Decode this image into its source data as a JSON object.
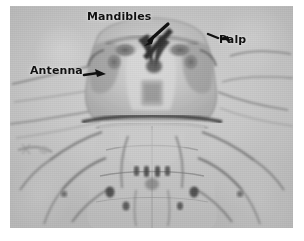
{
  "figure": {
    "kind": "photomicrograph",
    "background_color": "#c6c6c6",
    "ink_color": "#111111",
    "page_color": "#ffffff",
    "plate": {
      "left": 10,
      "top": 6,
      "width": 283,
      "height": 222
    }
  },
  "annotations": [
    {
      "id": "mandibles",
      "label": "Mandibles",
      "target": "paired dark sclerotized mandibles at center-top of head capsule",
      "arrow": "down-right-to-down-left diagonal leader",
      "text_position": {
        "x": 77,
        "y": 5
      }
    },
    {
      "id": "palp",
      "label": "Palp",
      "target": "maxillary palp at right margin of head",
      "arrow": "left-pointing arrowhead",
      "text_position": {
        "x": 209,
        "y": 28
      }
    },
    {
      "id": "antenna",
      "label": "Antenna",
      "target": "antenna at left margin of head",
      "arrow": "right-pointing arrowhead",
      "text_position": {
        "x": 20,
        "y": 59
      }
    }
  ],
  "anatomy": {
    "head_capsule": "broad trapezoidal sclerotized head, darker laterally, pale medially",
    "mandibles": "two dark hooked mandibles meeting at midline",
    "antennae": "long slender filaments sweeping outward to left and right",
    "palps": "short segmented appendages flanking the mouthparts",
    "thorax": "translucent segmented body below head with fine dark setae and leg bases",
    "legs": "slender darker limbs radiating laterally from the thoracic segments"
  }
}
